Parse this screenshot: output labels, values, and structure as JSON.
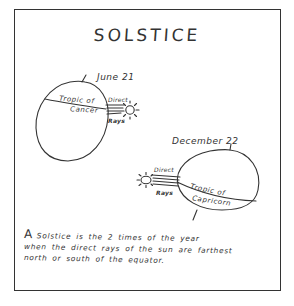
{
  "title": "SOLSTICE",
  "diagrams": {
    "june": {
      "date_label": "June 21",
      "tropic_label_line1": "Tropic of",
      "tropic_label_line2": "Cancer",
      "rays_label_top": "Direct",
      "rays_label_bottom": "Rays",
      "sun_icon": "sun-icon"
    },
    "december": {
      "date_label": "December 22",
      "tropic_label_line1": "Tropic of",
      "tropic_label_line2": "Capricorn",
      "rays_label_top": "Direct",
      "rays_label_bottom": "Rays",
      "sun_icon": "sun-icon"
    }
  },
  "caption": {
    "lead": "A",
    "line1": "Solstice  is the  2 times   of the year",
    "line2": "when the direct rays of the sun are farthest",
    "line3": "north or south of the equator."
  },
  "colors": {
    "ink": "#333333",
    "background": "#ffffff"
  }
}
